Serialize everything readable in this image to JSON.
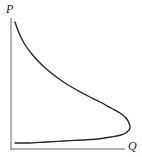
{
  "figure": {
    "background_color": "#ffffff",
    "width": 142,
    "height": 157,
    "axes": {
      "vertical": {
        "label": "P",
        "label_icon": "axis-label-p",
        "color": "#666666",
        "x": 11,
        "y_top": 18,
        "y_bottom": 150,
        "stroke_width": 1
      },
      "horizontal": {
        "label": "Q",
        "label_icon": "axis-label-q",
        "color": "#666666",
        "y": 149,
        "x_left": 11,
        "x_right": 125,
        "stroke_width": 1
      }
    }
  },
  "chart_data": {
    "type": "line",
    "xlabel": "Q",
    "ylabel": "P",
    "grid": false,
    "legend": null,
    "axis_origin": [
      11,
      149
    ],
    "xlim": [
      0,
      142
    ],
    "ylim": [
      0,
      157
    ],
    "series": [
      {
        "name": "backward-bending-curve",
        "color": "#262626",
        "stroke_width": 1.4,
        "closed": false,
        "note": "C-shaped curve opening left: upper branch falls from top-left, bends back at right apex, lower branch returns to lower-left",
        "points_px": [
          [
            15,
            22
          ],
          [
            19,
            33
          ],
          [
            24,
            43
          ],
          [
            31,
            53
          ],
          [
            40,
            63
          ],
          [
            50,
            72
          ],
          [
            62,
            81
          ],
          [
            75,
            89
          ],
          [
            88,
            96
          ],
          [
            100,
            102
          ],
          [
            111,
            108
          ],
          [
            120,
            113
          ],
          [
            126,
            118
          ],
          [
            129,
            123
          ],
          [
            130,
            128
          ],
          [
            127,
            132
          ],
          [
            121,
            135
          ],
          [
            111,
            137
          ],
          [
            98,
            139
          ],
          [
            82,
            140
          ],
          [
            64,
            141
          ],
          [
            46,
            142
          ],
          [
            29,
            143
          ],
          [
            15,
            143
          ]
        ],
        "apex_px": [
          130,
          124
        ],
        "start_px": [
          15,
          22
        ],
        "end_px": [
          15,
          143
        ]
      }
    ]
  }
}
